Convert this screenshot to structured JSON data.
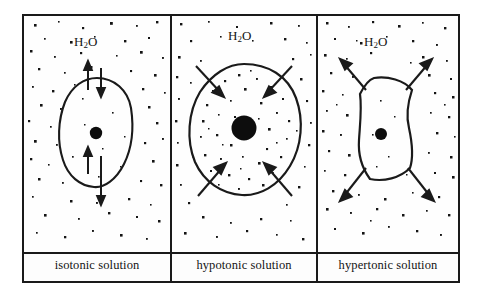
{
  "figure": {
    "water_label": "H2O",
    "water_label_html": "H<sub>2</sub>O"
  },
  "panels": [
    {
      "id": "isotonic",
      "label": "isotonic solution",
      "water_label": "H2O",
      "cell_shape": "round-normal",
      "nucleus_size": "small",
      "arrow_direction": "bidirectional",
      "arrow_count": 4,
      "arrow_meaning": "equal water movement in and out",
      "solute_density_outside": "medium",
      "solute_density_inside": "medium",
      "cell_state": "normal"
    },
    {
      "id": "hypotonic",
      "label": "hypotonic solution",
      "water_label": "H2O",
      "cell_shape": "round-swollen",
      "nucleus_size": "large",
      "arrow_direction": "inward",
      "arrow_count": 4,
      "arrow_meaning": "net water movement into cell",
      "solute_density_outside": "low",
      "solute_density_inside": "high",
      "cell_state": "swollen"
    },
    {
      "id": "hypertonic",
      "label": "hypertonic solution",
      "water_label": "H2O",
      "cell_shape": "crenated-shrunken",
      "nucleus_size": "small",
      "arrow_direction": "outward",
      "arrow_count": 4,
      "arrow_meaning": "net water movement out of cell",
      "solute_density_outside": "high",
      "solute_density_inside": "low",
      "cell_state": "shrunken"
    }
  ],
  "colors": {
    "ink": "#1a1a1a",
    "background": "#fdfdfd",
    "nucleus": "#0d0d0d",
    "solute_dot": "#141414"
  }
}
